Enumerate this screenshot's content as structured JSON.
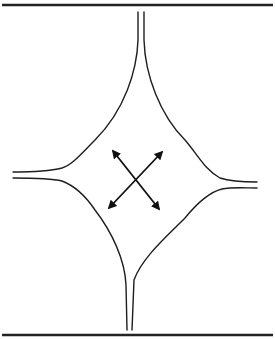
{
  "diagram": {
    "kind": "four-way junction schematic with bidirectional diagonal arrows",
    "colors": {
      "line": "#1e1e1e",
      "background": "#ffffff",
      "arrow": "#111111"
    },
    "elements": {
      "top_rule": "horizontal border line",
      "bottom_rule": "horizontal border line",
      "channels": [
        "top",
        "bottom",
        "left",
        "right"
      ],
      "arrows": [
        "diagonal arrow upper-left to lower-right",
        "diagonal arrow upper-right to lower-left"
      ]
    }
  }
}
